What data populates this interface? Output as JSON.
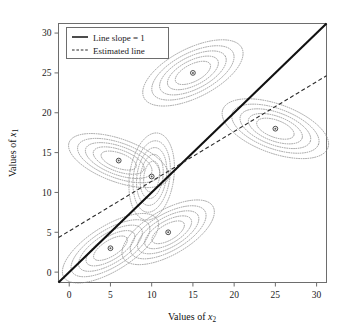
{
  "chart_data": {
    "type": "scatter",
    "title": "",
    "subtitle": "",
    "xlabel": "Values of x2",
    "ylabel": "Values of x1",
    "xlabel_base": "Values of ",
    "xlabel_var": "x",
    "xlabel_sub": "2",
    "ylabel_base": "Values of ",
    "ylabel_var": "x",
    "ylabel_sub": "1",
    "xlim": [
      -1.3,
      31.2
    ],
    "ylim": [
      -1.3,
      31.2
    ],
    "xticks": [
      0,
      5,
      10,
      15,
      20,
      25,
      30
    ],
    "yticks": [
      0,
      5,
      10,
      15,
      20,
      25,
      30
    ],
    "xtick_labels": [
      "0",
      "5",
      "10",
      "15",
      "20",
      "25",
      "30"
    ],
    "ytick_labels": [
      "0",
      "5",
      "10",
      "15",
      "20",
      "25",
      "30"
    ],
    "grid": false,
    "legend_position": "upper-left",
    "points": [
      {
        "name": "cluster-center-1",
        "x": 5,
        "y": 3,
        "label": "(5, 3)"
      },
      {
        "name": "cluster-center-2",
        "x": 6,
        "y": 14,
        "label": "(6, 14)"
      },
      {
        "name": "cluster-center-3",
        "x": 10,
        "y": 12,
        "label": "(10, 12)"
      },
      {
        "name": "cluster-center-4",
        "x": 12,
        "y": 5,
        "label": "(12, 5)"
      },
      {
        "name": "cluster-center-5",
        "x": 15,
        "y": 25,
        "label": "(15, 25)"
      },
      {
        "name": "cluster-center-6",
        "x": 25,
        "y": 18,
        "label": "(25, 18)"
      }
    ],
    "contours": [
      {
        "name": "contour-cluster-1",
        "cx": 5,
        "cy": 3,
        "rx": 5.2,
        "ry": 2.2,
        "angle": -32,
        "rings": [
          0.45,
          0.65,
          0.85,
          1.05,
          1.28
        ]
      },
      {
        "name": "contour-cluster-2",
        "cx": 6,
        "cy": 14,
        "rx": 5.0,
        "ry": 2.1,
        "angle": 20,
        "rings": [
          0.45,
          0.65,
          0.85,
          1.05,
          1.28
        ]
      },
      {
        "name": "contour-cluster-3",
        "cx": 10,
        "cy": 12,
        "rx": 2.1,
        "ry": 4.3,
        "angle": 8,
        "rings": [
          0.45,
          0.65,
          0.85,
          1.05,
          1.28
        ]
      },
      {
        "name": "contour-cluster-4",
        "cx": 12,
        "cy": 5,
        "rx": 4.9,
        "ry": 2.2,
        "angle": -30,
        "rings": [
          0.45,
          0.65,
          0.85,
          1.05,
          1.28
        ]
      },
      {
        "name": "contour-cluster-5",
        "cx": 15,
        "cy": 25,
        "rx": 5.2,
        "ry": 2.4,
        "angle": -27,
        "rings": [
          0.45,
          0.65,
          0.85,
          1.05,
          1.28
        ]
      },
      {
        "name": "contour-cluster-6",
        "cx": 25,
        "cy": 18,
        "rx": 5.3,
        "ry": 2.4,
        "angle": 20,
        "rings": [
          0.45,
          0.65,
          0.85,
          1.05,
          1.28
        ]
      }
    ],
    "series": [
      {
        "name": "Line slope = 1",
        "type": "line",
        "style": "solid",
        "slope": 1,
        "intercept": 0,
        "x": [
          -1.3,
          31.2
        ],
        "values": [
          -1.3,
          31.2
        ]
      },
      {
        "name": "Estimated line",
        "type": "line",
        "style": "dashed",
        "slope": 0.625,
        "intercept": 5.15,
        "x": [
          -1.3,
          31.2
        ],
        "values": [
          4.34,
          24.65
        ]
      }
    ]
  },
  "legend": {
    "items": [
      {
        "label": "Line slope = 1",
        "style": "solid"
      },
      {
        "label": "Estimated line",
        "style": "dashed"
      }
    ]
  }
}
